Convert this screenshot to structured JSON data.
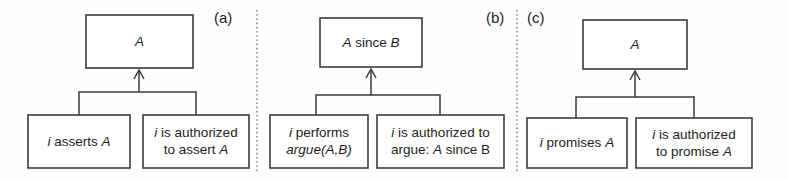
{
  "figure": {
    "background_color": "#fefefe",
    "line_color": "#3b3b3b",
    "divider_color": "#8a8a8a",
    "text_color": "#1d1d1d"
  },
  "panels": [
    {
      "id": "a",
      "label": "(a)",
      "label_x": 214,
      "label_y": 19,
      "conclusion": {
        "id": "a-conclusion",
        "x": 86,
        "y": 15,
        "w": 107,
        "h": 53,
        "lines": [
          [
            {
              "t": "A",
              "style": "italic"
            }
          ]
        ],
        "plain": "A"
      },
      "premises": [
        {
          "id": "a-premise-left",
          "x": 28,
          "y": 115,
          "w": 102,
          "h": 53,
          "lines": [
            [
              {
                "t": "i",
                "style": "italic"
              },
              {
                "t": " asserts ",
                "style": "roman"
              },
              {
                "t": "A",
                "style": "italic"
              }
            ]
          ],
          "plain": "i asserts A"
        },
        {
          "id": "a-premise-right",
          "x": 143,
          "y": 115,
          "w": 106,
          "h": 53,
          "lines": [
            [
              {
                "t": "i",
                "style": "italic"
              },
              {
                "t": " is authorized",
                "style": "roman"
              }
            ],
            [
              {
                "t": "to assert ",
                "style": "roman"
              },
              {
                "t": "A",
                "style": "italic"
              }
            ]
          ],
          "plain": "i is authorized to assert A"
        }
      ],
      "link": {
        "bar_y": 92,
        "bar_left": 79,
        "bar_right": 196,
        "stub_bottom": 115,
        "arrow_x": 139,
        "arrow_top": 70,
        "arrow_head_w": 5,
        "arrow_head_h": 9
      }
    },
    {
      "id": "b",
      "label": "(b)",
      "label_x": 486,
      "label_y": 19,
      "conclusion": {
        "id": "b-conclusion",
        "x": 320,
        "y": 18,
        "w": 102,
        "h": 49,
        "lines": [
          [
            {
              "t": "A",
              "style": "italic"
            },
            {
              "t": " since ",
              "style": "roman"
            },
            {
              "t": "B",
              "style": "italic"
            }
          ]
        ],
        "plain": "A since B"
      },
      "premises": [
        {
          "id": "b-premise-left",
          "x": 270,
          "y": 115,
          "w": 98,
          "h": 53,
          "lines": [
            [
              {
                "t": "i",
                "style": "italic"
              },
              {
                "t": " performs",
                "style": "roman"
              }
            ],
            [
              {
                "t": "argue(A,B)",
                "style": "italic"
              }
            ]
          ],
          "plain": "i performs argue(A,B)"
        },
        {
          "id": "b-premise-right",
          "x": 377,
          "y": 115,
          "w": 127,
          "h": 53,
          "lines": [
            [
              {
                "t": "i",
                "style": "italic"
              },
              {
                "t": " is authorized to",
                "style": "roman"
              }
            ],
            [
              {
                "t": "argue: ",
                "style": "roman"
              },
              {
                "t": "A",
                "style": "italic"
              },
              {
                "t": " since B",
                "style": "roman"
              }
            ]
          ],
          "plain": "i is authorized to argue: A since B"
        }
      ],
      "link": {
        "bar_y": 95,
        "bar_left": 316,
        "bar_right": 440,
        "stub_bottom": 115,
        "arrow_x": 371,
        "arrow_top": 69,
        "arrow_head_w": 5,
        "arrow_head_h": 9
      }
    },
    {
      "id": "c",
      "label": "(c)",
      "label_x": 527,
      "label_y": 19,
      "conclusion": {
        "id": "c-conclusion",
        "x": 583,
        "y": 20,
        "w": 104,
        "h": 49,
        "lines": [
          [
            {
              "t": "A",
              "style": "italic"
            }
          ]
        ],
        "plain": "A"
      },
      "premises": [
        {
          "id": "c-premise-left",
          "x": 527,
          "y": 118,
          "w": 100,
          "h": 50,
          "lines": [
            [
              {
                "t": "i",
                "style": "italic"
              },
              {
                "t": " promises ",
                "style": "roman"
              },
              {
                "t": "A",
                "style": "italic"
              }
            ]
          ],
          "plain": "i promises A"
        },
        {
          "id": "c-premise-right",
          "x": 636,
          "y": 118,
          "w": 116,
          "h": 50,
          "lines": [
            [
              {
                "t": "i",
                "style": "italic"
              },
              {
                "t": " is authorized",
                "style": "roman"
              }
            ],
            [
              {
                "t": "to promise ",
                "style": "roman"
              },
              {
                "t": "A",
                "style": "italic"
              }
            ]
          ],
          "plain": "i is authorized to promise A"
        }
      ],
      "link": {
        "bar_y": 97,
        "bar_left": 576,
        "bar_right": 694,
        "stub_bottom": 118,
        "arrow_x": 635,
        "arrow_top": 71,
        "arrow_head_w": 5,
        "arrow_head_h": 9
      }
    }
  ],
  "dividers": [
    {
      "id": "divider-a-b",
      "x": 257,
      "y1": 10,
      "y2": 172
    },
    {
      "id": "divider-b-c",
      "x": 517,
      "y1": 10,
      "y2": 172
    }
  ]
}
